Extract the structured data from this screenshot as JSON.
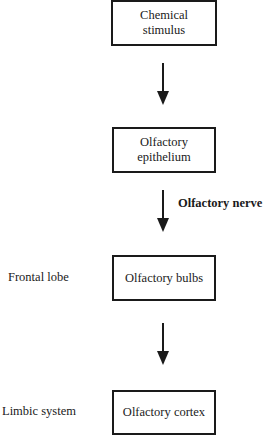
{
  "diagram": {
    "type": "flowchart",
    "direction": "top-to-bottom",
    "nodes": [
      {
        "id": "stimulus",
        "line1": "Chemical",
        "line2": "stimulus"
      },
      {
        "id": "epithelium",
        "line1": "Olfactory",
        "line2": "epithelium"
      },
      {
        "id": "bulbs",
        "label": "Olfactory bulbs",
        "side_label": "Frontal lobe"
      },
      {
        "id": "cortex",
        "label": "Olfactory cortex",
        "side_label": "Limbic system"
      }
    ],
    "edges": [
      {
        "from": "stimulus",
        "to": "epithelium",
        "label": ""
      },
      {
        "from": "epithelium",
        "to": "bulbs",
        "label": "Olfactory nerve"
      },
      {
        "from": "bulbs",
        "to": "cortex",
        "label": ""
      }
    ]
  }
}
